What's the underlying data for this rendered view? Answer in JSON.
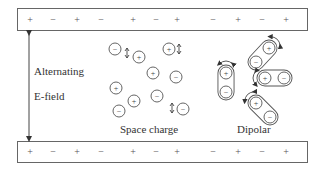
{
  "diagram": {
    "top_plate": {
      "signs": [
        {
          "s": "+",
          "x": 29
        },
        {
          "s": "−",
          "x": 52
        },
        {
          "s": "+",
          "x": 76
        },
        {
          "s": "−",
          "x": 100
        },
        {
          "s": "+",
          "x": 132
        },
        {
          "s": "−",
          "x": 155
        },
        {
          "s": "+",
          "x": 176
        },
        {
          "s": "−",
          "x": 212
        },
        {
          "s": "+",
          "x": 237
        },
        {
          "s": "−",
          "x": 261
        },
        {
          "s": "+",
          "x": 285
        }
      ]
    },
    "bottom_plate": {
      "signs": [
        {
          "s": "+",
          "x": 29
        },
        {
          "s": "−",
          "x": 52
        },
        {
          "s": "+",
          "x": 76
        },
        {
          "s": "−",
          "x": 100
        },
        {
          "s": "+",
          "x": 132
        },
        {
          "s": "−",
          "x": 155
        },
        {
          "s": "+",
          "x": 176
        },
        {
          "s": "−",
          "x": 212
        },
        {
          "s": "+",
          "x": 237
        },
        {
          "s": "−",
          "x": 261
        },
        {
          "s": "+",
          "x": 285
        }
      ]
    },
    "field_label_line1": "Alternating",
    "field_label_line2": "E-field",
    "space_charge_label": "Space charge",
    "dipolar_label": "Dipolar",
    "space_charge_particles": [
      {
        "sign": "−",
        "x": 115,
        "y": 49
      },
      {
        "sign": "+",
        "x": 139,
        "y": 57
      },
      {
        "sign": "+",
        "x": 169,
        "y": 49
      },
      {
        "sign": "+",
        "x": 153,
        "y": 73
      },
      {
        "sign": "−",
        "x": 176,
        "y": 77
      },
      {
        "sign": "+",
        "x": 116,
        "y": 88
      },
      {
        "sign": "−",
        "x": 157,
        "y": 96
      },
      {
        "sign": "+",
        "x": 134,
        "y": 101
      },
      {
        "sign": "−",
        "x": 119,
        "y": 111
      },
      {
        "sign": "−",
        "x": 183,
        "y": 109
      }
    ],
    "vibration_arrows": [
      {
        "x": 127,
        "y": 53
      },
      {
        "x": 179,
        "y": 49
      },
      {
        "x": 172,
        "y": 108
      }
    ],
    "dipoles": [
      {
        "plus": [
          226,
          73
        ],
        "minus": [
          226,
          92
        ]
      },
      {
        "plus": [
          269,
          48
        ],
        "minus": [
          256,
          62
        ]
      },
      {
        "plus": [
          265,
          78
        ],
        "minus": [
          284,
          78
        ]
      },
      {
        "plus": [
          256,
          103
        ],
        "minus": [
          270,
          117
        ]
      }
    ],
    "colors": {
      "line": "#555555",
      "text": "#333333"
    }
  }
}
